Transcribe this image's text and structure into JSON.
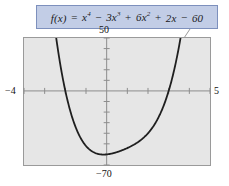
{
  "figure": {
    "background_color": "#ffffff",
    "callout": {
      "function_label": "f(x)",
      "equals": "=",
      "expression_plain": "f(x) = x^4 - 3x^3 + 6x^2 + 2x - 60",
      "terms": [
        {
          "coefficient": "",
          "variable": "x",
          "exponent": "4",
          "operator": ""
        },
        {
          "coefficient": "3",
          "variable": "x",
          "exponent": "3",
          "operator": "−"
        },
        {
          "coefficient": "6",
          "variable": "x",
          "exponent": "2",
          "operator": "+"
        },
        {
          "coefficient": "2",
          "variable": "x",
          "exponent": "",
          "operator": "+"
        },
        {
          "coefficient": "60",
          "variable": "",
          "exponent": "",
          "operator": "−"
        }
      ],
      "fill_color": "#c2cde6",
      "border_color": "#7d90bd",
      "text_color": "#1a1a24"
    },
    "plot_area": {
      "fill_color": "#e6e6e6",
      "border_color": "#9a9a9a",
      "curve_color": "#1a1a1a",
      "axis_color": "#8a8a8a",
      "leader_line_color": "#9a9a9a"
    }
  },
  "chart_data": {
    "type": "line",
    "title": "",
    "subtitle": "",
    "xlabel": "",
    "ylabel": "",
    "annotation": "f(x) = x⁴ − 3x³ + 6x² + 2x − 60",
    "function": "x^4 - 3*x^3 + 6*x^2 + 2*x - 60",
    "coefficients": [
      1,
      -3,
      6,
      2,
      -60
    ],
    "degree": 4,
    "grid": false,
    "legend": "none",
    "xlim": [
      -4,
      5
    ],
    "ylim": [
      -70,
      50
    ],
    "x_tick_values": [
      -4,
      -3,
      -2,
      -1,
      0,
      1,
      2,
      3,
      4,
      5
    ],
    "y_tick_values": [
      -70,
      -60,
      -50,
      -40,
      -30,
      -20,
      -10,
      0,
      10,
      20,
      30,
      40,
      50
    ],
    "axis_tick_labels": {
      "x_min": "−4",
      "x_max": "5",
      "y_max": "50",
      "y_min": "−70"
    },
    "x_intercepts_approx": [
      -2.45,
      2.95
    ],
    "minimum_approx": {
      "x": -0.08,
      "y": -60.1
    },
    "series": [
      {
        "name": "f(x)",
        "x": [
          -4.0,
          -3.75,
          -3.5,
          -3.25,
          -3.0,
          -2.75,
          -2.5,
          -2.25,
          -2.0,
          -1.75,
          -1.5,
          -1.25,
          -1.0,
          -0.75,
          -0.5,
          -0.25,
          0.0,
          0.25,
          0.5,
          0.75,
          1.0,
          1.25,
          1.5,
          1.75,
          2.0,
          2.25,
          2.5,
          2.75,
          3.0,
          3.25,
          3.5,
          3.75,
          4.0,
          4.25,
          4.5,
          4.75,
          5.0
        ],
        "y": [
          388.0,
          301.3,
          228.6,
          168.4,
          119.0,
          79.0,
          47.1,
          22.2,
          3.0,
          -11.4,
          -21.6,
          -28.2,
          -32.0,
          -33.6,
          -32.6,
          -30.4,
          -60.0,
          -58.7,
          -57.1,
          -55.0,
          -52.0,
          -48.0,
          -42.6,
          -35.4,
          -26.0,
          -14.0,
          1.1,
          19.9,
          42.0,
          69.4,
          101.6,
          139.5,
          184.0,
          235.8,
          295.3,
          363.4,
          440.0
        ]
      }
    ],
    "curve_description": "Quartic opening upward; falls steeply from upper-left, crosses x-axis near x=-2.45, reaches a minimum near (0, -60), crosses x-axis near x=2.95, then rises steeply off the top-right of the frame."
  }
}
